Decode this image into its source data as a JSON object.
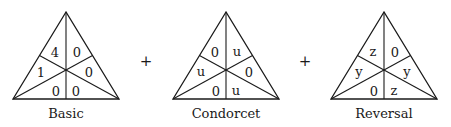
{
  "diagram": {
    "operators": [
      "+",
      "+"
    ],
    "triangles": [
      {
        "caption": "Basic",
        "regions": {
          "top_left": "4",
          "top_right": "0",
          "left": "1",
          "right": "0",
          "bottom_left": "0",
          "bottom_right": "0"
        }
      },
      {
        "caption": "Condorcet",
        "regions": {
          "top_left": "0",
          "top_right": "u",
          "left": "u",
          "right": "0",
          "bottom_left": "0",
          "bottom_right": "u"
        }
      },
      {
        "caption": "Reversal",
        "regions": {
          "top_left": "z",
          "top_right": "0",
          "left": "y",
          "right": "y",
          "bottom_left": "0",
          "bottom_right": "z"
        }
      }
    ]
  }
}
